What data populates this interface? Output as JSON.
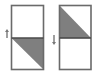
{
  "diagram": {
    "colors": {
      "background": "#ffffff",
      "border": "#6a6a6a",
      "divider": "#4a4a4a",
      "triangle_fill": "#7f7f7f",
      "arrow": "#777777"
    },
    "panels": [
      {
        "id": "left",
        "rect": {
          "x": 11.5,
          "y": 5.5,
          "w": 32,
          "h": 64
        },
        "divider_y": 38,
        "triangle": [
          [
            11.5,
            38
          ],
          [
            43.5,
            38
          ],
          [
            43.5,
            69.5
          ]
        ],
        "arrow": {
          "direction": "up",
          "x": 7,
          "y1": 38,
          "y2": 29
        }
      },
      {
        "id": "right",
        "rect": {
          "x": 59.5,
          "y": 5.5,
          "w": 31.5,
          "h": 64
        },
        "divider_y": 38,
        "triangle": [
          [
            59.5,
            5.5
          ],
          [
            91,
            38
          ],
          [
            59.5,
            38
          ]
        ],
        "arrow": {
          "direction": "down",
          "x": 54,
          "y1": 35,
          "y2": 45
        }
      }
    ]
  }
}
